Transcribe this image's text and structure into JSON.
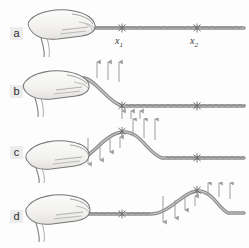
{
  "figure": {
    "background_color": "#fdfdfd",
    "rope_color": "#8a8a8a",
    "rope_shade": "#6f6f6f",
    "hand_outline": "#6b6b6b",
    "hand_fill": "#f4f3f1",
    "arrow_color": "#9a9a9a",
    "label_color": "#2b2b2b",
    "label_badge_color": "#ececec"
  },
  "markers": {
    "x1": {
      "label": "x",
      "sub": "1",
      "x": 122
    },
    "x2": {
      "label": "x",
      "sub": "2",
      "x": 197
    }
  },
  "panels": [
    {
      "id": "a",
      "label": "a",
      "caption": "Rope at rest, held horizontally by the hand. Marked points x1 and x2 are undisplaced.",
      "rope_state": "flat",
      "hand_position": "gripping left end, rope horizontal",
      "arrows": []
    },
    {
      "id": "b",
      "label": "b",
      "caption": "The hand flicks the end of the rope upward; the near end rises while the rest of the rope is still undisturbed.",
      "rope_state": "end-lifted",
      "hand_position": "raised, rope sloping down to x1",
      "arrows": [
        {
          "direction": "up",
          "group": "above-hand",
          "count": 3
        },
        {
          "direction": "up",
          "group": "below-rope-at-x1",
          "count": 3
        }
      ]
    },
    {
      "id": "c",
      "label": "c",
      "caption": "A pulse has formed with its crest at x1. The hand has returned down; the rope behind the crest moves downward while the rope ahead of the crest begins to move upward.",
      "rope_state": "pulse-crest-at-x1",
      "hand_position": "lowered, rope rising to crest at x1",
      "arrows": [
        {
          "direction": "down",
          "group": "behind-crest",
          "count": 3
        },
        {
          "direction": "up",
          "group": "at-crest",
          "count": 1
        },
        {
          "direction": "up",
          "group": "ahead-of-crest",
          "count": 3
        }
      ]
    },
    {
      "id": "d",
      "label": "d",
      "caption": "The pulse has travelled along the rope and its crest is now at x2. The rope near x1 is flat again and the segment behind the crest moves downward.",
      "rope_state": "pulse-crest-at-x2",
      "hand_position": "lowered, rope flat from hand to x1",
      "arrows": [
        {
          "direction": "down",
          "group": "behind-crest",
          "count": 3
        },
        {
          "direction": "up",
          "group": "at-crest",
          "count": 1
        },
        {
          "direction": "up",
          "group": "ahead-of-crest",
          "count": 3
        }
      ]
    }
  ]
}
